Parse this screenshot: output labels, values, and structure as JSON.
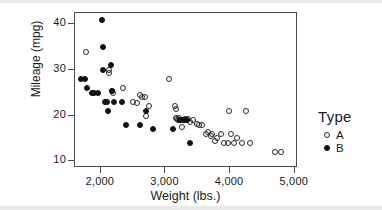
{
  "chart_data": {
    "type": "scatter",
    "title": "",
    "xlabel": "Weight (lbs.)",
    "ylabel": "Mileage (mpg)",
    "xlim": [
      1600,
      5050
    ],
    "ylim": [
      8.5,
      42.5
    ],
    "xticks": [
      2000,
      3000,
      4000,
      5000
    ],
    "xticklabels": [
      "2,000",
      "3,000",
      "4,000",
      "5,000"
    ],
    "yticks": [
      10,
      20,
      30,
      40
    ],
    "yticklabels": [
      "10",
      "20",
      "30",
      "40"
    ],
    "grid": false,
    "legend": {
      "title": "Type",
      "position": "right",
      "entries": [
        {
          "label": "A",
          "marker": "open-circle"
        },
        {
          "label": "B",
          "marker": "filled-circle"
        }
      ]
    },
    "series": [
      {
        "name": "A",
        "marker": "open-circle",
        "points": [
          [
            1775,
            34
          ],
          [
            2120,
            30
          ],
          [
            2130,
            29.3
          ],
          [
            2180,
            25.5
          ],
          [
            2190,
            25
          ],
          [
            2350,
            26
          ],
          [
            2500,
            23
          ],
          [
            2560,
            22.8
          ],
          [
            2600,
            24.5
          ],
          [
            2640,
            24
          ],
          [
            2680,
            24
          ],
          [
            2700,
            20
          ],
          [
            2740,
            22
          ],
          [
            3060,
            28
          ],
          [
            3150,
            22
          ],
          [
            3155,
            21.5
          ],
          [
            3170,
            19.5
          ],
          [
            3185,
            19.3
          ],
          [
            3200,
            19
          ],
          [
            3215,
            19.5
          ],
          [
            3230,
            19
          ],
          [
            3250,
            17.5
          ],
          [
            3270,
            19
          ],
          [
            3300,
            19.2
          ],
          [
            3320,
            19
          ],
          [
            3350,
            19.3
          ],
          [
            3380,
            18.5
          ],
          [
            3420,
            19
          ],
          [
            3480,
            18.2
          ],
          [
            3520,
            18
          ],
          [
            3560,
            18
          ],
          [
            3620,
            16
          ],
          [
            3660,
            16.5
          ],
          [
            3700,
            15.5
          ],
          [
            3720,
            16
          ],
          [
            3760,
            14.5
          ],
          [
            3800,
            15
          ],
          [
            3860,
            16
          ],
          [
            3900,
            14
          ],
          [
            3960,
            14
          ],
          [
            3990,
            21
          ],
          [
            4020,
            16
          ],
          [
            4060,
            14
          ],
          [
            4110,
            15
          ],
          [
            4180,
            14
          ],
          [
            4250,
            21
          ],
          [
            4310,
            14
          ],
          [
            4700,
            12
          ],
          [
            4790,
            12
          ]
        ]
      },
      {
        "name": "B",
        "marker": "filled-circle",
        "points": [
          [
            1700,
            28
          ],
          [
            1760,
            28
          ],
          [
            1790,
            26
          ],
          [
            1860,
            25
          ],
          [
            1900,
            25
          ],
          [
            1950,
            25
          ],
          [
            2020,
            41
          ],
          [
            2030,
            35
          ],
          [
            2040,
            30
          ],
          [
            2060,
            23
          ],
          [
            2100,
            23
          ],
          [
            2110,
            21
          ],
          [
            2150,
            31
          ],
          [
            2170,
            25.5
          ],
          [
            2200,
            23
          ],
          [
            2320,
            23
          ],
          [
            2390,
            18
          ],
          [
            2600,
            18
          ],
          [
            2700,
            21
          ],
          [
            2800,
            17
          ],
          [
            3110,
            17
          ],
          [
            3230,
            19
          ],
          [
            3280,
            19
          ],
          [
            3330,
            19
          ],
          [
            3380,
            14
          ]
        ]
      }
    ]
  }
}
